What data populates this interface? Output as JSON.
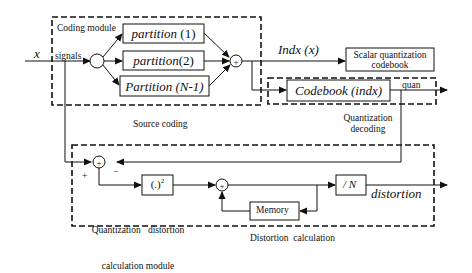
{
  "diagram": {
    "input": {
      "var": "x",
      "signals_label": "signals"
    },
    "coding_module": {
      "label": "Coding module",
      "partitions": [
        {
          "name": "partition",
          "arg": "(1)"
        },
        {
          "name": "partition",
          "arg": "(2)"
        },
        {
          "name": "Partition",
          "arg": "(N-1)"
        }
      ],
      "caption": "Source coding"
    },
    "index_output": "Indx (x)",
    "scalar_box": {
      "line1": "Scalar quantization",
      "line2": "codebook"
    },
    "codebook": {
      "name": "Codebook",
      "arg": "(indx)",
      "output": "quan"
    },
    "decoding_caption": {
      "line1": "Quantization",
      "line2": "decoding"
    },
    "distortion_module": {
      "plus_sign": "+",
      "minus_sign": "−",
      "square_box": "(.)",
      "square_exp": "2",
      "module_caption": {
        "line1": "Quantization   distortion",
        "line2": "calculation module"
      },
      "divide_box": "/ N",
      "memory_box": "Memory",
      "output": "distortion",
      "caption": "Distortion  calculation"
    },
    "sum_symbol": "+"
  }
}
